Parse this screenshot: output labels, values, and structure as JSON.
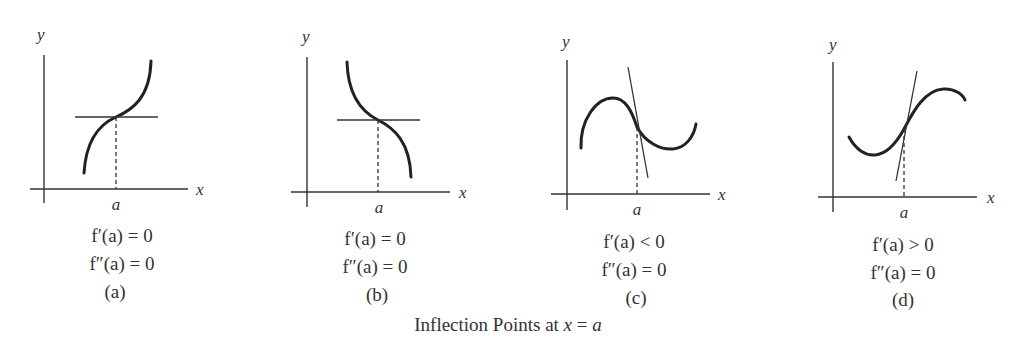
{
  "figure": {
    "caption": "Inflection Points at x = a",
    "caption_prefix": "Inflection Points at ",
    "caption_var": "x",
    "caption_eq": " = ",
    "caption_val": "a",
    "panels": [
      {
        "id": "a",
        "label": "(a)",
        "x_axis_label": "x",
        "y_axis_label": "y",
        "tick_label": "a",
        "first_derivative": "f′(a) = 0",
        "second_derivative": "f″(a) = 0",
        "description": "increasing curve, concave down then up, horizontal tangent at a"
      },
      {
        "id": "b",
        "label": "(b)",
        "x_axis_label": "x",
        "y_axis_label": "y",
        "tick_label": "a",
        "first_derivative": "f′(a) = 0",
        "second_derivative": "f″(a) = 0",
        "description": "decreasing curve, horizontal tangent at a"
      },
      {
        "id": "c",
        "label": "(c)",
        "x_axis_label": "x",
        "y_axis_label": "y",
        "tick_label": "a",
        "first_derivative": "f′(a) < 0",
        "second_derivative": "f″(a) = 0",
        "description": "curve with local max then min, negative-slope tangent at a"
      },
      {
        "id": "d",
        "label": "(d)",
        "x_axis_label": "x",
        "y_axis_label": "y",
        "tick_label": "a",
        "first_derivative": "f′(a) > 0",
        "second_derivative": "f″(a) = 0",
        "description": "curve with local min then max, positive-slope tangent at a"
      }
    ]
  }
}
